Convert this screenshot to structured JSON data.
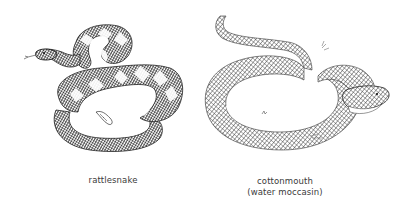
{
  "figure": {
    "panels": [
      {
        "name": "rattlesnake",
        "caption": "rattlesnake"
      },
      {
        "name": "cottonmouth",
        "caption_line1": "cottonmouth",
        "caption_line2": "(water moccasin)"
      }
    ],
    "colors": {
      "ink": "#2a2a2a",
      "background": "#ffffff",
      "caption": "#3a3a3a"
    }
  }
}
